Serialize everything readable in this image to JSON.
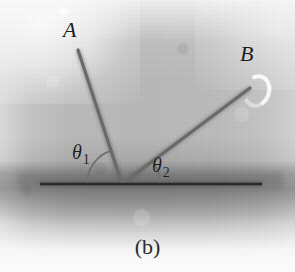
{
  "figure": {
    "caption": "(b)",
    "background_color": "#b9b9b9",
    "ink_color": "#2a2a2a",
    "ray_color": "#6a6a6a",
    "width": 295,
    "height": 272
  },
  "labels": {
    "ray_a": "A",
    "ray_b": "B",
    "theta1_symbol": "θ",
    "theta1_subscript": "1",
    "theta2_symbol": "θ",
    "theta2_subscript": "2"
  },
  "geometry": {
    "vertex": {
      "x": 122,
      "y": 184
    },
    "surface_line": {
      "x1": 40,
      "y1": 184,
      "x2": 262,
      "y2": 184
    },
    "ray_a": {
      "x1": 122,
      "y1": 184,
      "x2": 78,
      "y2": 50
    },
    "ray_b": {
      "x1": 122,
      "y1": 184,
      "x2": 250,
      "y2": 88
    },
    "angle_arc_theta1": {
      "radius": 35,
      "start_deg": 180,
      "end_deg": 108
    },
    "angle_arc_theta2": {
      "radius": 38,
      "start_deg": 0,
      "end_deg": 37
    }
  },
  "icons": {
    "crescent_artifact": "crescent-highlight-icon",
    "speck_artifact": "speck-highlight-icon"
  }
}
